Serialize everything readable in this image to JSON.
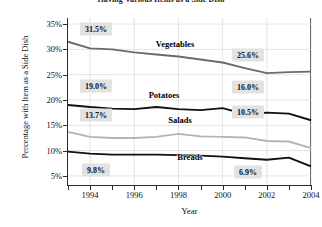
{
  "chart_data": {
    "type": "line",
    "title": "Having Various Items as a Side Dish",
    "xlabel": "Year",
    "ylabel": "Percentage with Item as a Side Dish",
    "x": [
      1993,
      1994,
      1995,
      1996,
      1997,
      1998,
      1999,
      2000,
      2001,
      2002,
      2003,
      2004
    ],
    "xlim": [
      1993,
      2004
    ],
    "ylim": [
      3.2,
      36.2
    ],
    "xtick_labels": [
      "1994",
      "1996",
      "1998",
      "2000",
      "2002",
      "2004"
    ],
    "xtick_values": [
      1994,
      1996,
      1998,
      2000,
      2002,
      2004
    ],
    "ytick_labels": [
      "5%",
      "10%",
      "15%",
      "20%",
      "25%",
      "30%",
      "35%"
    ],
    "ytick_values": [
      5,
      10,
      15,
      20,
      25,
      30,
      35
    ],
    "grid": true,
    "legend": "inline-series-labels",
    "series": [
      {
        "name": "Vegetables",
        "color": "#6b6b6b",
        "values": [
          31.5,
          30.2,
          30.0,
          29.4,
          29.0,
          28.6,
          28.0,
          27.4,
          26.3,
          25.3,
          25.5,
          25.6
        ],
        "start_label": "31.5%",
        "end_label": "25.6%"
      },
      {
        "name": "Potatoes",
        "color": "#111111",
        "values": [
          19.0,
          18.6,
          18.3,
          18.2,
          18.6,
          18.2,
          18.0,
          18.4,
          17.2,
          17.5,
          17.3,
          16.0
        ],
        "start_label": "19.0%",
        "end_label": "16.0%"
      },
      {
        "name": "Salads",
        "color": "#b4b4b4",
        "values": [
          13.7,
          12.7,
          12.5,
          12.5,
          12.7,
          13.3,
          12.8,
          12.7,
          12.6,
          11.9,
          11.8,
          10.5
        ],
        "start_label": "13.7%",
        "end_label": "10.5%"
      },
      {
        "name": "Breads",
        "color": "#111111",
        "values": [
          9.8,
          9.4,
          9.2,
          9.2,
          9.2,
          9.1,
          9.0,
          8.8,
          8.5,
          8.2,
          8.6,
          6.9
        ],
        "start_label": "9.8%",
        "end_label": "6.9%"
      }
    ],
    "callouts": [
      {
        "text": "31.5%",
        "series": "Vegetables",
        "side": "start"
      },
      {
        "text": "25.6%",
        "series": "Vegetables",
        "side": "end"
      },
      {
        "text": "19.0%",
        "series": "Potatoes",
        "side": "start"
      },
      {
        "text": "16.0%",
        "series": "Potatoes",
        "side": "end"
      },
      {
        "text": "13.7%",
        "series": "Salads",
        "side": "start"
      },
      {
        "text": "10.5%",
        "series": "Salads",
        "side": "end"
      },
      {
        "text": "9.8%",
        "series": "Breads",
        "side": "start"
      },
      {
        "text": "6.9%",
        "series": "Breads",
        "side": "end"
      }
    ]
  }
}
